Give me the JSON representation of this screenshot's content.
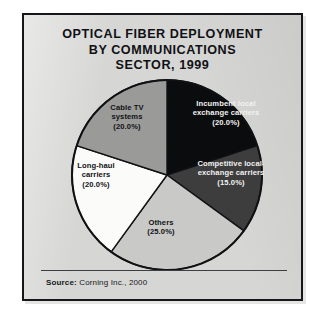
{
  "figure": {
    "title_lines": [
      "OPTICAL FIBER DEPLOYMENT",
      "BY COMMUNICATIONS",
      "SECTOR, 1999"
    ],
    "source_label": "Source:",
    "source_text": "Corning Inc., 2000",
    "background_color": "#d6d6d4",
    "frame_color": "#15171a"
  },
  "chart_data": {
    "type": "pie",
    "title": "OPTICAL FIBER DEPLOYMENT BY COMMUNICATIONS SECTOR, 1999",
    "xlabel": "",
    "ylabel": "",
    "legend_position": "none",
    "grid": false,
    "start_angle_deg": 0,
    "direction": "clockwise",
    "categories": [
      "Incumbent local exchange carriers",
      "Competitive local-exchange carriers",
      "Others",
      "Long-haul carriers",
      "Cable TV systems"
    ],
    "values": [
      20.0,
      15.0,
      25.0,
      20.0,
      20.0
    ],
    "slices": [
      {
        "name": "Incumbent local exchange carriers",
        "value": 20.0,
        "value_label": "(20.0%)",
        "label_lines": [
          "Incumbent local",
          "exchange carriers",
          "(20.0%)"
        ],
        "color": "#0b0c0d",
        "text_color": "#f2f2f2",
        "start_deg": 0,
        "end_deg": 72
      },
      {
        "name": "Competitive local-exchange carriers",
        "value": 15.0,
        "value_label": "(15.0%)",
        "label_lines": [
          "Competitive local-",
          "exchange carriers",
          "(15.0%)"
        ],
        "color": "#3d3d3d",
        "text_color": "#f2f2f2",
        "start_deg": 72,
        "end_deg": 126
      },
      {
        "name": "Others",
        "value": 25.0,
        "value_label": "(25.0%)",
        "label_lines": [
          "Others",
          "(25.0%)"
        ],
        "color": "#c9c9c7",
        "text_color": "#111214",
        "start_deg": 126,
        "end_deg": 216
      },
      {
        "name": "Long-haul carriers",
        "value": 20.0,
        "value_label": "(20.0%)",
        "label_lines": [
          "Long-haul",
          "carriers",
          "(20.0%)"
        ],
        "color": "#fbfbfa",
        "text_color": "#111214",
        "start_deg": 216,
        "end_deg": 288
      },
      {
        "name": "Cable TV systems",
        "value": 20.0,
        "value_label": "(20.0%)",
        "label_lines": [
          "Cable TV",
          "systems",
          "(20.0%)"
        ],
        "color": "#9a9a98",
        "text_color": "#111214",
        "start_deg": 288,
        "end_deg": 360
      }
    ],
    "source": "Source: Corning Inc., 2000"
  }
}
